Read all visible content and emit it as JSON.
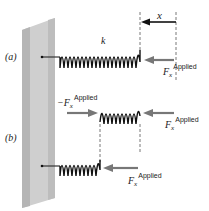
{
  "labels": {
    "part_a": "(a)",
    "part_b": "(b)",
    "spring_constant": "k",
    "displacement": "x",
    "force_symbol": "F",
    "force_sub": "x",
    "force_sup": "Applied",
    "neg_force_prefix": "−F"
  },
  "colors": {
    "wall_front": "#c8c8c8",
    "wall_side": "#a9a9a9",
    "spring": "#111111",
    "arrow": "#777777",
    "dashed": "#555555"
  }
}
